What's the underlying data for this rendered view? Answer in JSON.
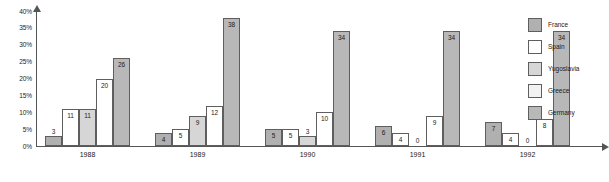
{
  "chart_data": {
    "type": "bar",
    "title": "",
    "subtitle": "",
    "xlabel": "",
    "ylabel": "",
    "grid": false,
    "legend_position": "right",
    "ylim": [
      0,
      40
    ],
    "y_unit": "%",
    "y_ticks": [
      "0%",
      "5%",
      "10%",
      "15%",
      "20%",
      "25%",
      "30%",
      "35%",
      "40%"
    ],
    "y_tick_values": [
      0,
      5,
      10,
      15,
      20,
      25,
      30,
      35,
      40
    ],
    "categories": [
      "1988",
      "1989",
      "1990",
      "1991",
      "1992"
    ],
    "series": [
      {
        "name": "France",
        "color": "#b0b0b0",
        "values": [
          3,
          4,
          5,
          6,
          7
        ]
      },
      {
        "name": "Spain",
        "color": "#ffffff",
        "values": [
          11,
          5,
          5,
          4,
          4
        ]
      },
      {
        "name": "Yugoslavia",
        "color": "#d6d6d6",
        "values": [
          11,
          9,
          3,
          0,
          0
        ]
      },
      {
        "name": "Greece",
        "color": "#ffffff",
        "values": [
          20,
          12,
          10,
          9,
          8
        ]
      },
      {
        "name": "Germany",
        "color": "#b8b8b8",
        "values": [
          26,
          38,
          34,
          34,
          34
        ]
      }
    ]
  },
  "legend": {
    "items": [
      {
        "label": "France",
        "color": "#b0b0b0"
      },
      {
        "label": "Spain",
        "color": "#ffffff"
      },
      {
        "label": "Yugoslavia",
        "color": "#d6d6d6"
      },
      {
        "label": "Greece",
        "color": "#f2f2f2"
      },
      {
        "label": "Germany",
        "color": "#b8b8b8"
      }
    ]
  },
  "axis_colors": {
    "line": "#555555",
    "text": "#1a1a1a",
    "bar_border": "#5e5e5e"
  }
}
